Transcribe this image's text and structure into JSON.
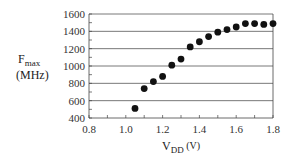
{
  "chart_data": {
    "type": "scatter",
    "title": "",
    "xlabel": "V_DD (V)",
    "xlabel_main": "V",
    "xlabel_sub": "DD",
    "xlabel_unit": " (V)",
    "ylabel": "F_max (MHz)",
    "ylabel_main": "F",
    "ylabel_sub": "max",
    "ylabel_unit": "(MHz)",
    "xlim": [
      0.8,
      1.8
    ],
    "ylim": [
      400,
      1600
    ],
    "xticks": [
      0.8,
      1.0,
      1.2,
      1.4,
      1.6,
      1.8
    ],
    "xtick_labels": [
      "0.8",
      "1.0",
      "1.2",
      "1.4",
      "1.6",
      "1.8"
    ],
    "xminor_step": 0.1,
    "yticks": [
      400,
      600,
      800,
      1000,
      1200,
      1400,
      1600
    ],
    "ytick_labels": [
      "400",
      "600",
      "800",
      "1000",
      "1200",
      "1400",
      "1600"
    ],
    "yminor_step": 100,
    "grid": "horizontal",
    "legend": null,
    "series": [
      {
        "name": "Fmax",
        "x": [
          1.05,
          1.1,
          1.15,
          1.2,
          1.25,
          1.3,
          1.35,
          1.4,
          1.45,
          1.5,
          1.55,
          1.6,
          1.65,
          1.7,
          1.75,
          1.8
        ],
        "y": [
          510,
          740,
          820,
          880,
          1010,
          1080,
          1220,
          1280,
          1340,
          1390,
          1420,
          1450,
          1490,
          1490,
          1480,
          1490
        ]
      }
    ]
  },
  "colors": {
    "marker": "#111111",
    "grid": "#555555",
    "axis": "#444444"
  }
}
